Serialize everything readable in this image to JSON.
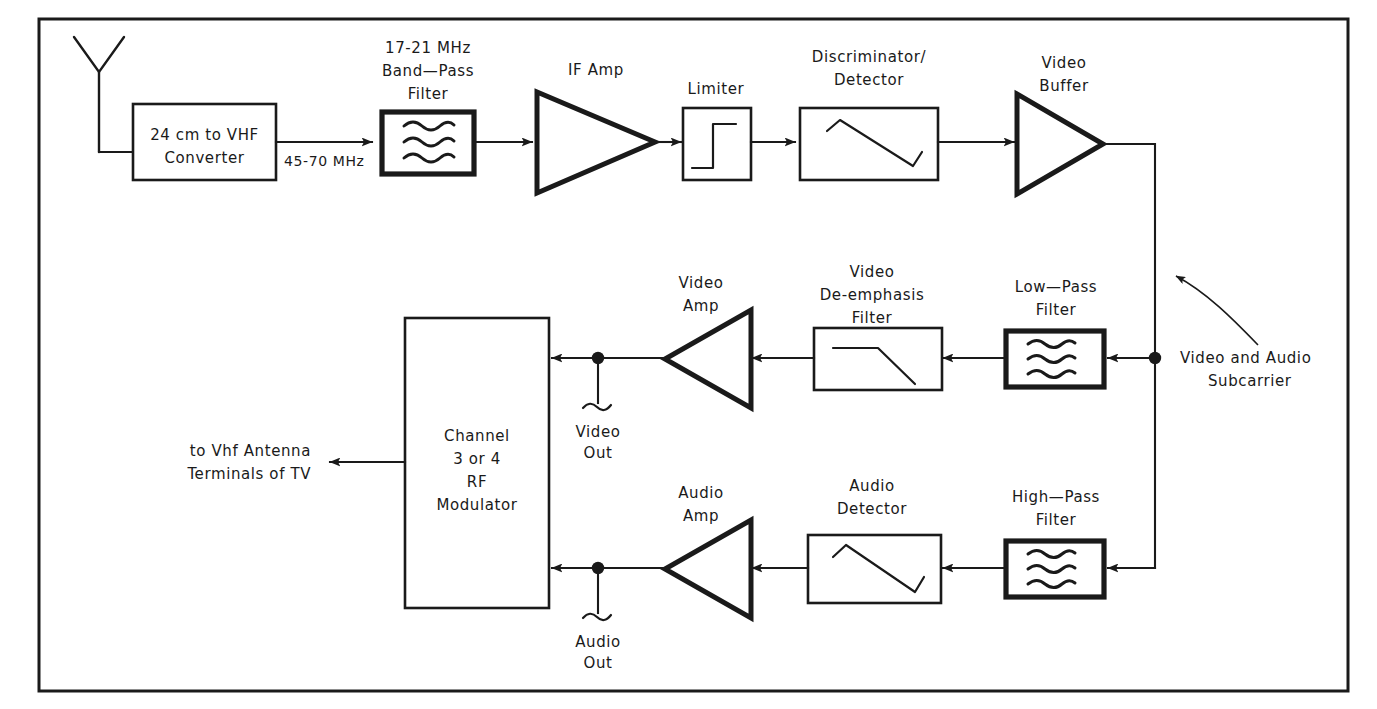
{
  "diagram": {
    "frame": {
      "present": true
    },
    "antenna": {
      "name": "receive-antenna"
    },
    "signal_labels": {
      "converter_output_freq": "45-70 MHz"
    },
    "blocks": [
      {
        "id": "converter",
        "label_lines": [
          "24 cm to VHF",
          "Converter"
        ],
        "label_position": "inside",
        "shape": "rect"
      },
      {
        "id": "bandpass-filter",
        "label_lines": [
          "17-21 MHz",
          "Band—Pass",
          "Filter"
        ],
        "label_position": "above",
        "shape": "rect-filter",
        "glyph": "wave-triple"
      },
      {
        "id": "if-amp",
        "label_lines": [
          "IF Amp"
        ],
        "label_position": "above",
        "shape": "triangle-right"
      },
      {
        "id": "limiter",
        "label_lines": [
          "Limiter"
        ],
        "label_position": "above",
        "shape": "rect",
        "glyph": "step"
      },
      {
        "id": "discriminator",
        "label_lines": [
          "Discriminator/",
          "Detector"
        ],
        "label_position": "above",
        "shape": "rect",
        "glyph": "s-curve"
      },
      {
        "id": "video-buffer",
        "label_lines": [
          "Video",
          "Buffer"
        ],
        "label_position": "above",
        "shape": "triangle-right"
      },
      {
        "id": "lowpass-filter",
        "label_lines": [
          "Low—Pass",
          "Filter"
        ],
        "label_position": "above",
        "shape": "rect-filter",
        "glyph": "wave-triple"
      },
      {
        "id": "de-emphasis-filter",
        "label_lines": [
          "Video",
          "De-emphasis",
          "Filter"
        ],
        "label_position": "above",
        "shape": "rect",
        "glyph": "rolloff"
      },
      {
        "id": "video-amp",
        "label_lines": [
          "Video",
          "Amp"
        ],
        "label_position": "above",
        "shape": "triangle-left"
      },
      {
        "id": "highpass-filter",
        "label_lines": [
          "High—Pass",
          "Filter"
        ],
        "label_position": "above",
        "shape": "rect-filter",
        "glyph": "wave-triple"
      },
      {
        "id": "audio-detector",
        "label_lines": [
          "Audio",
          "Detector"
        ],
        "label_position": "above",
        "shape": "rect",
        "glyph": "s-curve"
      },
      {
        "id": "audio-amp",
        "label_lines": [
          "Audio",
          "Amp"
        ],
        "label_position": "above",
        "shape": "triangle-left"
      },
      {
        "id": "rf-modulator",
        "label_lines": [
          "Channel",
          "3 or 4",
          "RF",
          "Modulator"
        ],
        "label_position": "inside",
        "shape": "rect-tall"
      }
    ],
    "taps": [
      {
        "id": "video-out",
        "label_lines": [
          "Video",
          "Out"
        ]
      },
      {
        "id": "audio-out",
        "label_lines": [
          "Audio",
          "Out"
        ]
      }
    ],
    "annotations": [
      {
        "id": "subcarrier-callout",
        "label_lines": [
          "Video and Audio",
          "Subcarrier"
        ],
        "arrow": "curved-up-left"
      },
      {
        "id": "tv-output-callout",
        "label_lines": [
          "to Vhf Antenna",
          "Terminals of TV"
        ],
        "arrow": "straight-left"
      }
    ],
    "colors": {
      "ink": "#1a1a1a",
      "paper": "#ffffff"
    }
  }
}
